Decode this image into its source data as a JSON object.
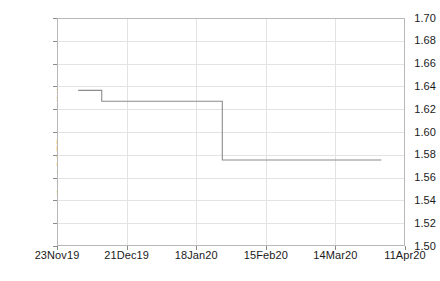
{
  "chart_data": {
    "type": "line",
    "title": "",
    "subtitle": "",
    "xlabel": "",
    "ylabel": "fitted SOFR curve (%)",
    "ylim": [
      1.5,
      1.7
    ],
    "ytick_labels": [
      "1.70",
      "1.68",
      "1.66",
      "1.64",
      "1.62",
      "1.60",
      "1.58",
      "1.56",
      "1.54",
      "1.52",
      "1.50"
    ],
    "ytick_values": [
      1.7,
      1.68,
      1.66,
      1.64,
      1.62,
      1.6,
      1.58,
      1.56,
      1.54,
      1.52,
      1.5
    ],
    "xtick_labels": [
      "23Nov19",
      "21Dec19",
      "18Jan20",
      "15Feb20",
      "14Mar20",
      "11Apr20"
    ],
    "xtick_positions": [
      0,
      28,
      56,
      84,
      112,
      140
    ],
    "xlim": [
      0,
      140
    ],
    "xlim_labels": [
      "23Nov19",
      "11Apr20"
    ],
    "grid": "both",
    "legend": "none",
    "line_color": "#8c8c8c",
    "series": [
      {
        "name": "fitted SOFR curve",
        "step": "post",
        "x": [
          8.5,
          18.0,
          18.0,
          66.5,
          66.5,
          130.5
        ],
        "y": [
          1.6365,
          1.6365,
          1.627,
          1.627,
          1.5755,
          1.5755
        ],
        "levels": [
          1.6365,
          1.627,
          1.5755
        ],
        "break_x": [
          18.0,
          66.5
        ],
        "start_x": 8.5,
        "end_x": 130.5
      }
    ],
    "annotations": []
  },
  "axes": {
    "plot_left_px": 57,
    "plot_top_px": 18,
    "plot_width_px": 348,
    "plot_height_px": 228
  }
}
